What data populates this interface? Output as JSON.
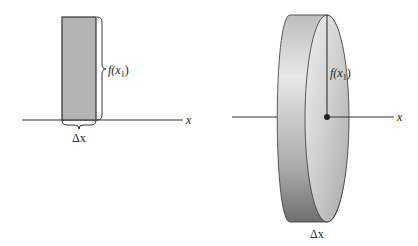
{
  "left_figure": {
    "name": "rectangle-strip",
    "height_label": "f(x",
    "height_label_sub": "1",
    "height_label_close": ")",
    "width_label": "Δx",
    "axis_label": "x",
    "colors": {
      "fill": "#b3b3b3",
      "stroke": "#333333"
    }
  },
  "right_figure": {
    "name": "disk-of-revolution",
    "radius_label": "f(x",
    "radius_label_sub": "1",
    "radius_label_close": ")",
    "thickness_label": "Δx",
    "axis_label": "x",
    "colors": {
      "light": "#e6e6e6",
      "mid": "#bdbdbd",
      "dark": "#7a7a7a",
      "stroke": "#333333"
    }
  }
}
